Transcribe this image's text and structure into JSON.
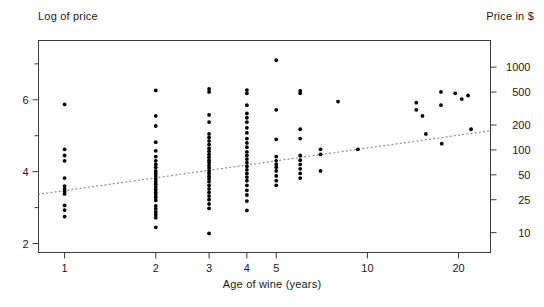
{
  "labels": {
    "y_left_title": "Log of price",
    "y_right_title": "Price in $",
    "x_title": "Age of wine (years)"
  },
  "chart_data": {
    "type": "scatter",
    "title": "",
    "xlabel": "Age of wine (years)",
    "ylabel": "Log of price",
    "y2label": "Price in $",
    "xscale": "log",
    "yscale": "linear",
    "grid": false,
    "legend": "none",
    "xlim": [
      0.82,
      25.5
    ],
    "ylim": [
      1.75,
      7.65
    ],
    "xticks": [
      1,
      2,
      3,
      4,
      5,
      10,
      20
    ],
    "xticklabels": [
      "1",
      "2",
      "3",
      "4",
      "5",
      "10",
      "20"
    ],
    "yticks": [
      2,
      3,
      4,
      5,
      6,
      7
    ],
    "yticklabels": [
      "2",
      "",
      "4",
      "",
      "6",
      ""
    ],
    "y2ticks": [
      10,
      25,
      50,
      100,
      200,
      500,
      1000
    ],
    "y2ticklabels": [
      "10",
      "25",
      "50",
      "100",
      "200",
      "500",
      "1000"
    ],
    "annotations": [
      {
        "type": "trendline",
        "style": "dotted",
        "x": [
          0.82,
          25.5
        ],
        "y": [
          3.37,
          5.14
        ]
      }
    ],
    "series": [
      {
        "name": "wine prices",
        "marker": "filled-circle",
        "color": "#000000",
        "points": [
          [
            1,
            5.87
          ],
          [
            1,
            4.62
          ],
          [
            1,
            4.45
          ],
          [
            1,
            4.3
          ],
          [
            1,
            3.82
          ],
          [
            1,
            3.6
          ],
          [
            1,
            3.52
          ],
          [
            1,
            3.45
          ],
          [
            1,
            3.38
          ],
          [
            1,
            3.06
          ],
          [
            1,
            2.93
          ],
          [
            1,
            2.75
          ],
          [
            2,
            6.26
          ],
          [
            2,
            5.55
          ],
          [
            2,
            5.27
          ],
          [
            2,
            4.82
          ],
          [
            2,
            4.58
          ],
          [
            2,
            4.42
          ],
          [
            2,
            4.3
          ],
          [
            2,
            4.2
          ],
          [
            2,
            4.12
          ],
          [
            2,
            4.02
          ],
          [
            2,
            3.95
          ],
          [
            2,
            3.88
          ],
          [
            2,
            3.8
          ],
          [
            2,
            3.72
          ],
          [
            2,
            3.65
          ],
          [
            2,
            3.57
          ],
          [
            2,
            3.5
          ],
          [
            2,
            3.42
          ],
          [
            2,
            3.35
          ],
          [
            2,
            3.28
          ],
          [
            2,
            3.2
          ],
          [
            2,
            3.05
          ],
          [
            2,
            2.97
          ],
          [
            2,
            2.88
          ],
          [
            2,
            2.8
          ],
          [
            2,
            2.72
          ],
          [
            2,
            2.45
          ],
          [
            3,
            6.3
          ],
          [
            3,
            6.22
          ],
          [
            3,
            5.58
          ],
          [
            3,
            5.38
          ],
          [
            3,
            5.05
          ],
          [
            3,
            4.95
          ],
          [
            3,
            4.85
          ],
          [
            3,
            4.75
          ],
          [
            3,
            4.65
          ],
          [
            3,
            4.57
          ],
          [
            3,
            4.48
          ],
          [
            3,
            4.4
          ],
          [
            3,
            4.32
          ],
          [
            3,
            4.25
          ],
          [
            3,
            4.17
          ],
          [
            3,
            4.1
          ],
          [
            3,
            4.02
          ],
          [
            3,
            3.95
          ],
          [
            3,
            3.87
          ],
          [
            3,
            3.8
          ],
          [
            3,
            3.72
          ],
          [
            3,
            3.62
          ],
          [
            3,
            3.52
          ],
          [
            3,
            3.42
          ],
          [
            3,
            3.32
          ],
          [
            3,
            3.22
          ],
          [
            3,
            3.1
          ],
          [
            3,
            2.98
          ],
          [
            3,
            2.28
          ],
          [
            4,
            6.27
          ],
          [
            4,
            6.18
          ],
          [
            4,
            5.85
          ],
          [
            4,
            5.62
          ],
          [
            4,
            5.5
          ],
          [
            4,
            5.38
          ],
          [
            4,
            5.22
          ],
          [
            4,
            5.08
          ],
          [
            4,
            4.92
          ],
          [
            4,
            4.8
          ],
          [
            4,
            4.68
          ],
          [
            4,
            4.55
          ],
          [
            4,
            4.45
          ],
          [
            4,
            4.35
          ],
          [
            4,
            4.25
          ],
          [
            4,
            4.15
          ],
          [
            4,
            4.05
          ],
          [
            4,
            3.95
          ],
          [
            4,
            3.85
          ],
          [
            4,
            3.75
          ],
          [
            4,
            3.62
          ],
          [
            4,
            3.48
          ],
          [
            4,
            3.35
          ],
          [
            4,
            3.18
          ],
          [
            4,
            2.92
          ],
          [
            5,
            7.1
          ],
          [
            5,
            5.72
          ],
          [
            5,
            4.9
          ],
          [
            5,
            4.42
          ],
          [
            5,
            4.3
          ],
          [
            5,
            4.2
          ],
          [
            5,
            4.12
          ],
          [
            5,
            4.02
          ],
          [
            5,
            3.88
          ],
          [
            5,
            3.75
          ],
          [
            5,
            3.62
          ],
          [
            6,
            6.25
          ],
          [
            6,
            6.18
          ],
          [
            6,
            5.18
          ],
          [
            6,
            4.92
          ],
          [
            6,
            4.45
          ],
          [
            6,
            4.32
          ],
          [
            6,
            4.2
          ],
          [
            6,
            4.08
          ],
          [
            6,
            3.95
          ],
          [
            6,
            3.82
          ],
          [
            7,
            4.62
          ],
          [
            7,
            4.48
          ],
          [
            7,
            4.02
          ],
          [
            8,
            5.95
          ],
          [
            9.3,
            4.62
          ],
          [
            14.5,
            5.92
          ],
          [
            14.5,
            5.72
          ],
          [
            15.2,
            5.55
          ],
          [
            15.6,
            5.05
          ],
          [
            17.5,
            6.22
          ],
          [
            17.5,
            5.85
          ],
          [
            17.6,
            4.78
          ],
          [
            19.5,
            6.18
          ],
          [
            20.5,
            6.02
          ],
          [
            21.5,
            6.12
          ],
          [
            22,
            5.18
          ]
        ]
      }
    ]
  }
}
